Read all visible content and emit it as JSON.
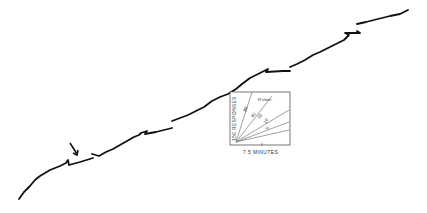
{
  "chart_data": {
    "type": "line",
    "title": "",
    "xlabel": "",
    "ylabel": "",
    "grid": false,
    "annotations": [
      {
        "type": "arrow",
        "position": [
          75,
          152
        ],
        "label": ""
      }
    ],
    "inset": {
      "xlabel": "7.5 MINUTES",
      "ylabel": "150 RESPONSES",
      "rate_unit_label": "R's/min",
      "rate_lines": [
        "80",
        "40",
        "20",
        "10",
        "5"
      ]
    },
    "series": [
      {
        "name": "cumulative-record",
        "segments": [
          [
            [
              19,
              199
            ],
            [
              24,
              192
            ],
            [
              30,
              186
            ],
            [
              35,
              180
            ],
            [
              40,
              176
            ],
            [
              45,
              173
            ],
            [
              50,
              170
            ],
            [
              55,
              168
            ],
            [
              60,
              166
            ],
            [
              66,
              163
            ],
            [
              68,
              160
            ],
            [
              69,
              165
            ],
            [
              80,
              162
            ],
            [
              93,
              158
            ]
          ],
          [
            [
              92,
              154
            ],
            [
              99,
              156
            ],
            [
              106,
              152
            ],
            [
              113,
              149
            ],
            [
              120,
              145
            ],
            [
              127,
              141
            ],
            [
              134,
              137
            ],
            [
              139,
              135
            ],
            [
              141,
              133
            ],
            [
              147,
              131
            ],
            [
              145,
              134
            ],
            [
              156,
              132
            ],
            [
              172,
              128
            ]
          ],
          [
            [
              172,
              121
            ],
            [
              180,
              118
            ],
            [
              188,
              115
            ],
            [
              196,
              111
            ],
            [
              204,
              107
            ],
            [
              212,
              101
            ],
            [
              220,
              97
            ],
            [
              228,
              94
            ],
            [
              236,
              89
            ],
            [
              242,
              84
            ],
            [
              250,
              78
            ],
            [
              260,
              73
            ],
            [
              268,
              69
            ],
            [
              266,
              72
            ],
            [
              283,
              71
            ],
            [
              290,
              71
            ]
          ],
          [
            [
              290,
              67
            ],
            [
              297,
              64
            ],
            [
              305,
              60
            ],
            [
              313,
              55
            ],
            [
              320,
              52
            ],
            [
              328,
              48
            ],
            [
              336,
              44
            ],
            [
              344,
              40
            ],
            [
              349,
              35
            ],
            [
              345,
              33
            ],
            [
              360,
              33
            ],
            [
              357,
              31
            ]
          ],
          [
            [
              357,
              24
            ],
            [
              366,
              22
            ],
            [
              378,
              19
            ],
            [
              390,
              16
            ],
            [
              400,
              14
            ],
            [
              408,
              10
            ]
          ]
        ]
      }
    ]
  },
  "inset": {
    "xlabel": "7.5 MINUTES",
    "ylabel": "150 RESPONSES",
    "rate_unit": "R's/min",
    "labels": {
      "l80": "80",
      "l40": "40",
      "l20": "20",
      "l10": "10",
      "l5": "5"
    }
  }
}
